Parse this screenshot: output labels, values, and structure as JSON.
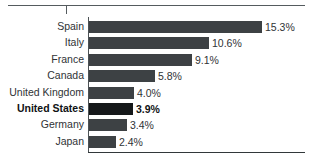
{
  "chart_data": {
    "type": "bar",
    "orientation": "horizontal",
    "title": "",
    "subtitle": "",
    "xlabel": "",
    "ylabel": "",
    "grid": false,
    "legend": null,
    "xlim": [
      0,
      17
    ],
    "value_suffix": "%",
    "categories": [
      "Spain",
      "Italy",
      "France",
      "Canada",
      "United Kingdom",
      "United States",
      "Germany",
      "Japan"
    ],
    "values": [
      15.3,
      10.6,
      9.1,
      5.8,
      4.0,
      3.9,
      3.4,
      2.4
    ],
    "value_labels": [
      "15.3%",
      "10.6%",
      "9.1%",
      "5.8%",
      "4.0%",
      "3.9%",
      "3.4%",
      "2.4%"
    ],
    "highlighted_category": "United States",
    "colors": {
      "bar": "#3d4144",
      "bar_highlight": "#15181a",
      "axis": "#32383a",
      "text": "#2f3336",
      "background": "#ffffff",
      "top_rule": "#555b5e"
    }
  },
  "rows": [
    {
      "label": "Spain",
      "value_label": "15.3%",
      "bar_px": 173,
      "highlight": false
    },
    {
      "label": "Italy",
      "value_label": "10.6%",
      "bar_px": 120,
      "highlight": false
    },
    {
      "label": "France",
      "value_label": "9.1%",
      "bar_px": 103,
      "highlight": false
    },
    {
      "label": "Canada",
      "value_label": "5.8%",
      "bar_px": 66,
      "highlight": false
    },
    {
      "label": "United Kingdom",
      "value_label": "4.0%",
      "bar_px": 45,
      "highlight": false
    },
    {
      "label": "United States",
      "value_label": "3.9%",
      "bar_px": 44,
      "highlight": true
    },
    {
      "label": "Germany",
      "value_label": "3.4%",
      "bar_px": 38,
      "highlight": false
    },
    {
      "label": "Japan",
      "value_label": "2.4%",
      "bar_px": 27,
      "highlight": false
    }
  ]
}
